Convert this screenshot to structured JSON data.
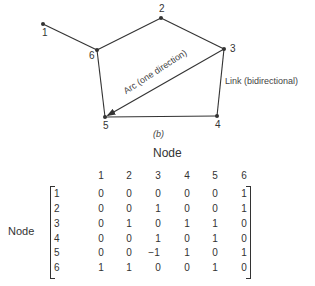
{
  "graph": {
    "nodes": [
      {
        "id": "1",
        "x": 43,
        "y": 24,
        "label_dx": -1,
        "label_dy": 4
      },
      {
        "id": "2",
        "x": 161,
        "y": 18,
        "label_dx": -2,
        "label_dy": -14
      },
      {
        "id": "3",
        "x": 224,
        "y": 49,
        "label_dx": 6,
        "label_dy": -5
      },
      {
        "id": "4",
        "x": 217,
        "y": 116,
        "label_dx": -2,
        "label_dy": 4
      },
      {
        "id": "5",
        "x": 105,
        "y": 117,
        "label_dx": -2,
        "label_dy": 4
      },
      {
        "id": "6",
        "x": 97,
        "y": 50,
        "label_dx": -8,
        "label_dy": 1
      }
    ],
    "edges": [
      {
        "from": "1",
        "to": "6",
        "type": "link"
      },
      {
        "from": "6",
        "to": "2",
        "type": "link"
      },
      {
        "from": "2",
        "to": "3",
        "type": "link"
      },
      {
        "from": "3",
        "to": "4",
        "type": "link"
      },
      {
        "from": "4",
        "to": "5",
        "type": "link"
      },
      {
        "from": "5",
        "to": "6",
        "type": "link"
      },
      {
        "from": "3",
        "to": "5",
        "type": "arc"
      }
    ],
    "arc_label": "Arc (one direction)",
    "link_label": "Link (bidirectional)",
    "caption": "(b)"
  },
  "matrix": {
    "title": "Node",
    "row_label": "Node",
    "col_headers": [
      "1",
      "2",
      "3",
      "4",
      "5",
      "6"
    ],
    "row_headers": [
      "1",
      "2",
      "3",
      "4",
      "5",
      "6"
    ],
    "rows": [
      [
        "0",
        "0",
        "0",
        "0",
        "0",
        "1"
      ],
      [
        "0",
        "0",
        "1",
        "0",
        "0",
        "1"
      ],
      [
        "0",
        "1",
        "0",
        "1",
        "1",
        "0"
      ],
      [
        "0",
        "0",
        "1",
        "0",
        "1",
        "0"
      ],
      [
        "0",
        "0",
        "−1",
        "1",
        "0",
        "1"
      ],
      [
        "1",
        "1",
        "0",
        "0",
        "1",
        "0"
      ]
    ]
  },
  "colors": {
    "line": "#333333",
    "text": "#333333"
  }
}
